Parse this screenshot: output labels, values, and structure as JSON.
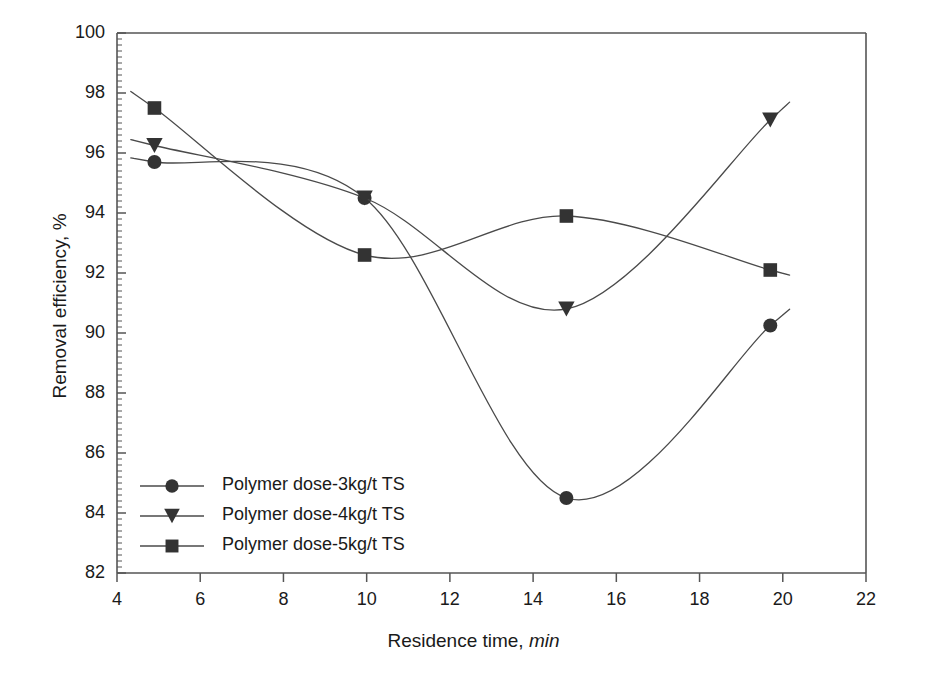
{
  "chart_data": {
    "type": "line",
    "title": "",
    "xlabel": "Residence time, min",
    "xlabel_plain": "Residence time,",
    "xlabel_unit": "min",
    "ylabel": "Removal efficiency, %",
    "xlim": [
      4,
      22
    ],
    "ylim": [
      82,
      100
    ],
    "xticks": [
      4,
      6,
      8,
      10,
      12,
      14,
      16,
      18,
      20,
      22
    ],
    "yticks": [
      82,
      84,
      86,
      88,
      90,
      92,
      94,
      96,
      98,
      100
    ],
    "xtick_labels": [
      "4",
      "6",
      "8",
      "10",
      "12",
      "14",
      "16",
      "18",
      "20",
      "22"
    ],
    "ytick_labels": [
      "82",
      "84",
      "86",
      "88",
      "90",
      "92",
      "94",
      "96",
      "98",
      "100"
    ],
    "grid": false,
    "minor_ticks": true,
    "legend_position": "lower-left-inside",
    "line_color": "#4a4a4a",
    "marker_color": "#333333",
    "axis_color": "#555555",
    "x": [
      4.9,
      9.95,
      14.8,
      19.7
    ],
    "series": [
      {
        "name": "Polymer dose-3kg/t TS",
        "marker": "circle",
        "values": [
          95.7,
          94.5,
          84.5,
          90.25
        ]
      },
      {
        "name": "Polymer dose-4kg/t TS",
        "marker": "triangle-down",
        "values": [
          96.25,
          94.5,
          90.8,
          97.1
        ]
      },
      {
        "name": "Polymer dose-5kg/t TS",
        "marker": "square",
        "values": [
          97.5,
          92.6,
          93.9,
          92.1
        ]
      }
    ]
  },
  "legend": {
    "items": [
      {
        "label": "Polymer dose-3kg/t TS",
        "marker": "circle"
      },
      {
        "label": "Polymer dose-4kg/t TS",
        "marker": "triangle-down"
      },
      {
        "label": "Polymer dose-5kg/t TS",
        "marker": "square"
      }
    ]
  }
}
